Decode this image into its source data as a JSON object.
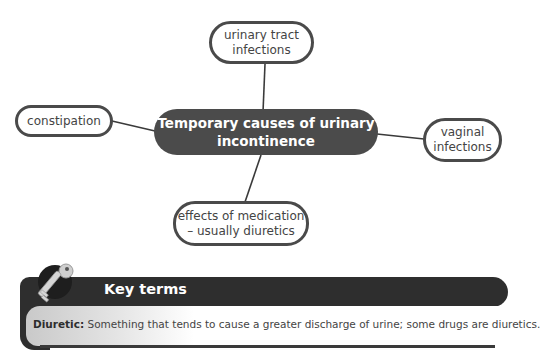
{
  "diagram": {
    "type": "mind-map",
    "center": {
      "line1": "Temporary causes of urinary",
      "line2": "incontinence"
    },
    "nodes": [
      {
        "id": "top",
        "line1": "urinary tract",
        "line2": "infections"
      },
      {
        "id": "left",
        "line1": "constipation"
      },
      {
        "id": "right",
        "line1": "vaginal",
        "line2": "infections"
      },
      {
        "id": "bottom",
        "line1": "effects of medication",
        "line2": "– usually diuretics"
      }
    ]
  },
  "key_terms": {
    "title": "Key terms",
    "icon": "key-icon",
    "term": "Diuretic:",
    "definition": " Something that tends to cause a greater discharge of urine; some drugs are diuretics."
  },
  "colors": {
    "center_fill": "#4b4b4b",
    "node_border": "#4a4a4a",
    "bar": "#2e2e2e"
  }
}
